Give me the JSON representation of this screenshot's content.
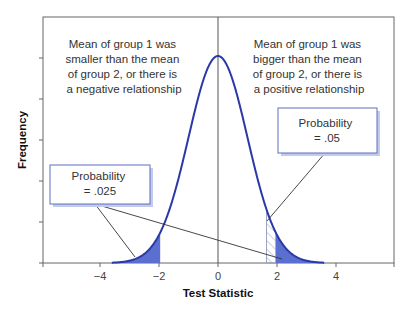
{
  "chart_data": {
    "type": "area",
    "title": "",
    "xlabel": "Test Statistic",
    "ylabel": "Frequency",
    "xlim": [
      -5.9,
      6.0
    ],
    "ylim": [
      0,
      0.42
    ],
    "x_ticks": [
      -4,
      -2,
      0,
      2,
      4
    ],
    "x_tick_labels": [
      "−4",
      "−2",
      "0",
      "2",
      "4"
    ],
    "y_tick_count": 5,
    "y_tick_labels": [],
    "grid": false,
    "series": [
      {
        "name": "Normal distribution curve",
        "distribution": "standard normal",
        "mean": 0,
        "sd": 1,
        "x_from": -3.6,
        "x_to": 3.6
      }
    ],
    "shaded_regions": [
      {
        "name": "Left tail (two-tailed)",
        "from": -3.6,
        "to": -1.96,
        "style": "solid",
        "color": "#5a6fd0",
        "probability": 0.025
      },
      {
        "name": "Right tail (two-tailed)",
        "from": 1.96,
        "to": 3.6,
        "style": "solid",
        "color": "#5a6fd0",
        "probability": 0.025
      },
      {
        "name": "Right tail (one-tailed)",
        "from": 1.645,
        "to": 1.96,
        "style": "hatched",
        "color": "#9aa3bf",
        "probability": 0.05
      }
    ],
    "reference_line": {
      "x": 0
    },
    "annotations": [
      {
        "id": "left-note",
        "lines": [
          "Mean of group 1 was",
          "smaller than the mean",
          "of group 2, or there is",
          "a negative relationship"
        ]
      },
      {
        "id": "right-note",
        "lines": [
          "Mean of group 1 was",
          "bigger than the mean",
          "of group 2, or there is",
          "a positive relationship"
        ]
      },
      {
        "id": "prob-025",
        "lines": [
          "Probability",
          "= .025"
        ],
        "points_to": [
          -2.6,
          2.1
        ]
      },
      {
        "id": "prob-05",
        "lines": [
          "Probability",
          "= .05"
        ],
        "points_to": [
          1.8
        ]
      }
    ],
    "colors": {
      "curve": "#2a38a8",
      "fill": "#5a6fd0",
      "frame": "#555555",
      "box_border": "#5b6fc4",
      "box_shadow": "#c3cbe9"
    }
  }
}
